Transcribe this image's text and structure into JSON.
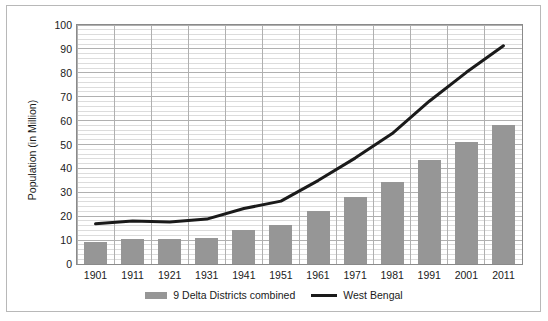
{
  "chart_data": {
    "type": "bar",
    "title": "",
    "subtitle": "",
    "xlabel": "",
    "ylabel": "Population (in Million)",
    "categories": [
      "1901",
      "1911",
      "1921",
      "1931",
      "1941",
      "1951",
      "1961",
      "1971",
      "1981",
      "1991",
      "2001",
      "2011"
    ],
    "series": [
      {
        "name": "9 Delta Districts combined",
        "type": "bar",
        "color": "#969696",
        "values": [
          9.2,
          10.4,
          10.4,
          10.8,
          14.2,
          16.5,
          22.0,
          28.0,
          34.5,
          43.5,
          51.0,
          58.0
        ]
      },
      {
        "name": "West Bengal",
        "type": "line",
        "color": "#1a1a1a",
        "values": [
          16.8,
          18.0,
          17.6,
          18.8,
          23.2,
          26.3,
          34.9,
          44.3,
          54.6,
          68.1,
          80.2,
          91.3
        ]
      }
    ],
    "ylim": [
      0,
      100
    ],
    "yticks": [
      0,
      10,
      20,
      30,
      40,
      50,
      60,
      70,
      80,
      90,
      100
    ],
    "ytick_labels": [
      "0",
      "10",
      "20",
      "30",
      "40",
      "50",
      "60",
      "70",
      "80",
      "90",
      "100"
    ],
    "y_minor_step": 2,
    "grid": {
      "major_horizontal": true,
      "minor_horizontal": true,
      "vertical": true
    },
    "legend": {
      "position": "bottom",
      "entries": [
        {
          "label": "9 Delta Districts combined",
          "marker": "bar-swatch",
          "color": "#969696"
        },
        {
          "label": "West Bengal",
          "marker": "line-swatch",
          "color": "#1a1a1a"
        }
      ]
    },
    "colors": {
      "bar": "#969696",
      "line": "#1a1a1a",
      "grid_major": "#b0b0b0",
      "grid_minor": "#dcdcdc",
      "axis": "#8a8a8a",
      "frame": "#b8b8b8",
      "background": "#ffffff",
      "text": "#1a1a1a"
    }
  }
}
